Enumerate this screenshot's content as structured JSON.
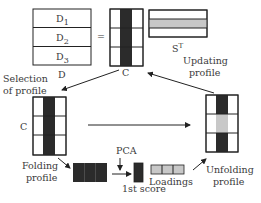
{
  "diagram": {
    "title": "",
    "matrix_d": {
      "name": "D",
      "rows": [
        "D",
        "D",
        "D"
      ],
      "row_subscripts": [
        "1",
        "2",
        "3"
      ]
    },
    "equals": "=",
    "matrix_c_top": {
      "name": "C"
    },
    "matrix_st": {
      "name": "S",
      "superscript": "T"
    },
    "matrix_c_left": {
      "name": "C"
    },
    "labels": {
      "selection_line1": "Selection",
      "selection_line2": "of profile",
      "updating_line1": "Updating",
      "updating_line2": "profile",
      "folding_line1": "Folding",
      "folding_line2": "profile",
      "unfolding_line1": "Unfolding",
      "unfolding_line2": "profile",
      "pca": "PCA",
      "first_score": "1st score",
      "loadings": "Loadings"
    },
    "colors": {
      "dark": "#2b2b2b",
      "gray": "#c8c8c8",
      "line": "#222222"
    }
  }
}
